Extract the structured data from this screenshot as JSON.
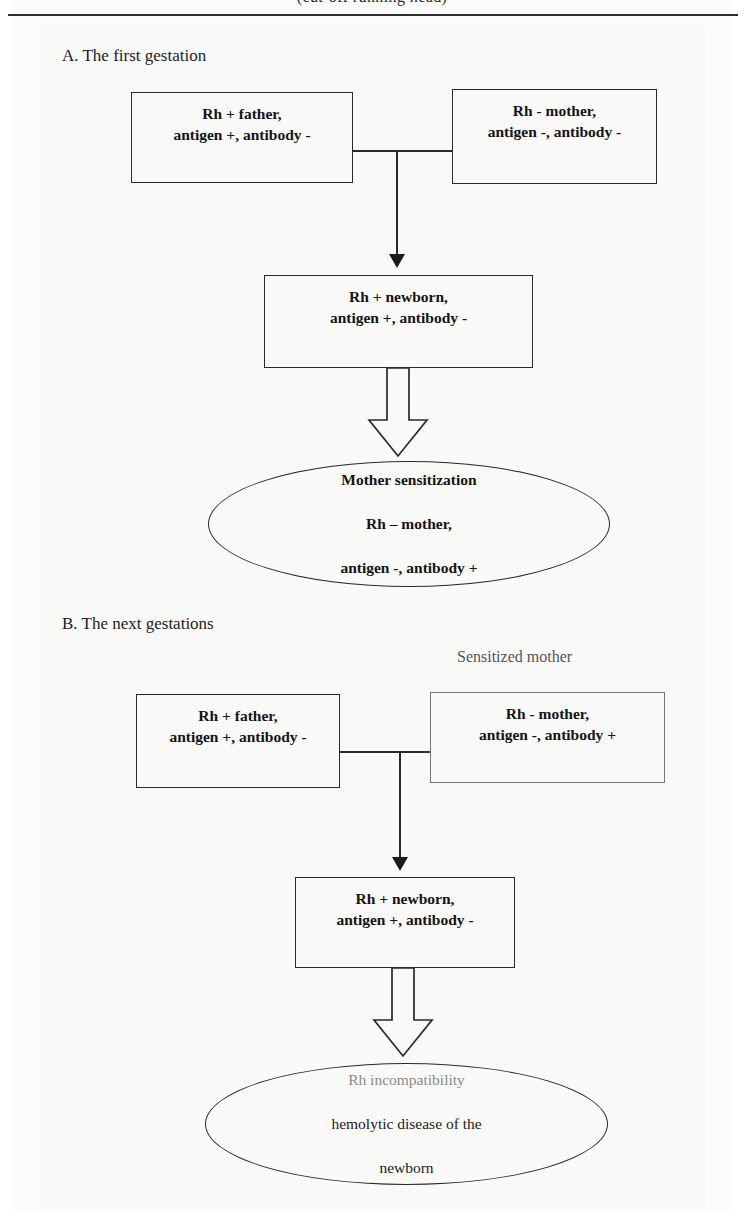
{
  "page": {
    "header_partial_text": "(cut-off running head)",
    "background_color": "#ffffff"
  },
  "sections": [
    {
      "id": "A",
      "title": "A. The first gestation",
      "nodes": {
        "father": "Rh +  father,\nantigen +, antibody -",
        "mother": "Rh - mother,\nantigen -, antibody -",
        "newborn": "Rh + newborn,\nantigen +, antibody -",
        "outcome_line1": "Mother sensitization",
        "outcome_line2": "Rh – mother,",
        "outcome_line3": "antigen -, antibody +"
      }
    },
    {
      "id": "B",
      "title": "B. The next gestations",
      "side_label": "Sensitized mother",
      "nodes": {
        "father": "Rh +  father,\nantigen +, antibody -",
        "mother": "Rh - mother,\nantigen -, antibody +",
        "newborn": "Rh + newborn,\nantigen +, antibody -",
        "outcome_line1": "Rh incompatibility",
        "outcome_line2": "hemolytic disease of the",
        "outcome_line3": "newborn"
      }
    }
  ],
  "colors": {
    "ink": "#141414",
    "rule": "#2e2e2e",
    "faint_ink": "#8a8a8a",
    "light_border": "#777777"
  },
  "icons": {
    "arrow_down": "down-arrow-icon",
    "block_arrow_down": "block-arrow-down-icon"
  }
}
